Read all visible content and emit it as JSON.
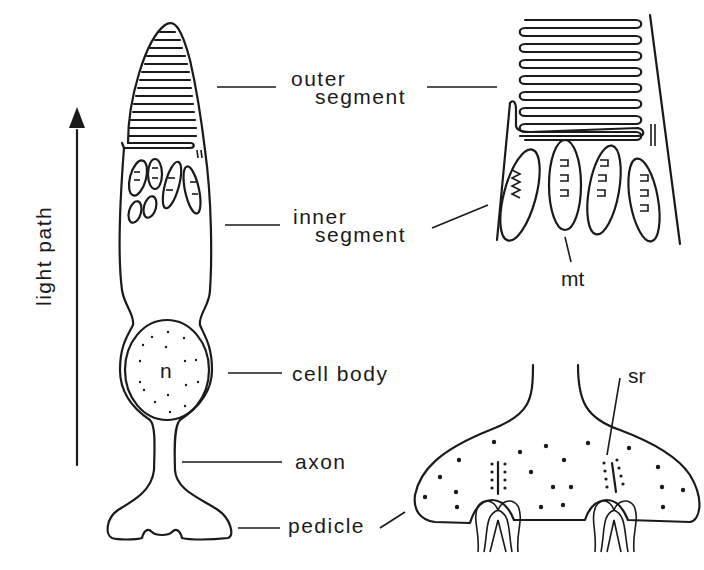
{
  "figure": {
    "axis_label": "light path",
    "labels": {
      "outer_segment_line1": "outer",
      "outer_segment_line2": "segment",
      "inner_segment_line1": "inner",
      "inner_segment_line2": "segment",
      "cell_body": "cell body",
      "axon": "axon",
      "pedicle": "pedicle",
      "nucleus": "n",
      "mitochondria": "mt",
      "synaptic_ribbon": "sr"
    },
    "colors": {
      "ink": "#1a1a1a",
      "background": "#ffffff"
    }
  }
}
